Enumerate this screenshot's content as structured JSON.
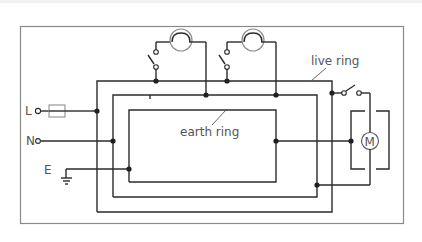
{
  "diagram": {
    "type": "ring-main circuit diagram",
    "labels": {
      "live": "L",
      "neutral": "N",
      "earth": "E",
      "live_ring": "live ring",
      "earth_ring": "earth ring",
      "motor": "M"
    },
    "components": [
      {
        "id": "fuse",
        "kind": "fuse",
        "on": "live supply"
      },
      {
        "id": "lamp-1",
        "kind": "lamp",
        "switched": true
      },
      {
        "id": "lamp-2",
        "kind": "lamp",
        "switched": true
      },
      {
        "id": "motor",
        "kind": "motor",
        "switched": true,
        "earthed_casing": true
      },
      {
        "id": "earth-symbol",
        "kind": "earth"
      }
    ],
    "rings": [
      "live ring (outer)",
      "neutral ring (middle)",
      "earth ring (inner)"
    ],
    "colors": {
      "wire": "#2b2b2b",
      "frame": "#8a8a8a",
      "text": "#555555",
      "background": "#ffffff"
    }
  }
}
